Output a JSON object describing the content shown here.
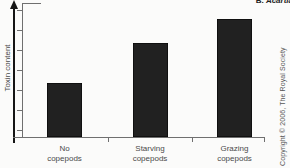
{
  "figure": {
    "panel_letter": "B.",
    "panel_species": "Acartia",
    "copyright": "Copyright © 2006, The Royal Society"
  },
  "chart_data": {
    "type": "bar",
    "title": "",
    "xlabel": "",
    "ylabel": "Toxin content",
    "categories": [
      "No copepods",
      "Starving copepods",
      "Grazing copepods"
    ],
    "values": [
      0.4,
      0.7,
      0.88
    ],
    "values_note": "relative bar heights estimated from figure; y-axis is an unlabeled arrow (increasing toxin content), no numeric tick labels",
    "ylim": [
      0,
      1
    ],
    "y_ticks_count": 7,
    "grid": false,
    "legend": false,
    "bar_color": "#212121",
    "axis_color": "#6f6f6f",
    "text_color": "#4a4a4a"
  }
}
